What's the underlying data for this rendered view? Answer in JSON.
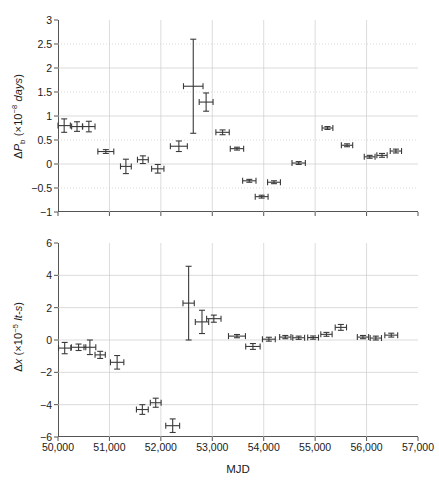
{
  "figure": {
    "xlabel": "MJD",
    "xticks": [
      "50,000",
      "51,000",
      "52,000",
      "53,000",
      "54,000",
      "55,000",
      "56,000",
      "57,000"
    ],
    "xtick_values": [
      50000,
      51000,
      52000,
      53000,
      54000,
      55000,
      56000,
      57000
    ],
    "xlim": [
      50000,
      57000
    ],
    "axis_color": "#555555",
    "grid_color": "#cccccc",
    "marker_color": "#3a3a3a"
  },
  "chart_data": [
    {
      "type": "scatter",
      "panel": "top",
      "title": "",
      "xlabel": "",
      "ylabel": "ΔP_b (×10⁻⁸ days)",
      "ylabel_parts": {
        "delta": "Δ",
        "symbol": "P",
        "subscript": "b",
        "units_prefix": " (×10",
        "exponent": "−8",
        "units": " days)"
      },
      "xlim": [
        50000,
        57000
      ],
      "ylim": [
        -1,
        3
      ],
      "yticks": [
        "-1",
        "-0.5",
        "0",
        "0.5",
        "1",
        "1.5",
        "2",
        "2.5",
        "3"
      ],
      "ytick_values": [
        -1,
        -0.5,
        0,
        0.5,
        1,
        1.5,
        2,
        2.5,
        3
      ],
      "grid": true,
      "legend": "none",
      "points": [
        {
          "x": 50120,
          "y": 0.8,
          "xerr": 120,
          "yerr": 0.14
        },
        {
          "x": 50370,
          "y": 0.78,
          "xerr": 105,
          "yerr": 0.1
        },
        {
          "x": 50600,
          "y": 0.78,
          "xerr": 120,
          "yerr": 0.11
        },
        {
          "x": 50930,
          "y": 0.26,
          "xerr": 155,
          "yerr": 0.04
        },
        {
          "x": 51320,
          "y": -0.05,
          "xerr": 105,
          "yerr": 0.15
        },
        {
          "x": 51650,
          "y": 0.09,
          "xerr": 105,
          "yerr": 0.08
        },
        {
          "x": 51940,
          "y": -0.1,
          "xerr": 120,
          "yerr": 0.09
        },
        {
          "x": 52350,
          "y": 0.37,
          "xerr": 165,
          "yerr": 0.11
        },
        {
          "x": 52630,
          "y": 1.62,
          "xerr": 190,
          "yerr": 0.98
        },
        {
          "x": 52880,
          "y": 1.29,
          "xerr": 135,
          "yerr": 0.19
        },
        {
          "x": 53200,
          "y": 0.66,
          "xerr": 130,
          "yerr": 0.05
        },
        {
          "x": 53480,
          "y": 0.32,
          "xerr": 130,
          "yerr": 0.03
        },
        {
          "x": 53720,
          "y": -0.35,
          "xerr": 130,
          "yerr": 0.03
        },
        {
          "x": 53960,
          "y": -0.68,
          "xerr": 125,
          "yerr": 0.03
        },
        {
          "x": 54200,
          "y": -0.38,
          "xerr": 125,
          "yerr": 0.03
        },
        {
          "x": 54680,
          "y": 0.02,
          "xerr": 130,
          "yerr": 0.03
        },
        {
          "x": 55240,
          "y": 0.75,
          "xerr": 105,
          "yerr": 0.03
        },
        {
          "x": 55620,
          "y": 0.39,
          "xerr": 110,
          "yerr": 0.03
        },
        {
          "x": 56060,
          "y": 0.15,
          "xerr": 105,
          "yerr": 0.03
        },
        {
          "x": 56300,
          "y": 0.18,
          "xerr": 100,
          "yerr": 0.04
        },
        {
          "x": 56570,
          "y": 0.27,
          "xerr": 110,
          "yerr": 0.04
        }
      ]
    },
    {
      "type": "scatter",
      "panel": "bottom",
      "title": "",
      "xlabel": "MJD",
      "ylabel": "Δx (×10⁻⁵ lt-s)",
      "ylabel_parts": {
        "delta": "Δ",
        "symbol": "x",
        "units_prefix": " (×10",
        "exponent": "−5",
        "units": " lt-s)"
      },
      "xlim": [
        50000,
        57000
      ],
      "ylim": [
        -6,
        6
      ],
      "yticks": [
        "-6",
        "-4",
        "-2",
        "0",
        "2",
        "4",
        "6"
      ],
      "ytick_values": [
        -6,
        -4,
        -2,
        0,
        2,
        4,
        6
      ],
      "grid": true,
      "legend": "none",
      "points": [
        {
          "x": 50130,
          "y": -0.5,
          "xerr": 120,
          "yerr": 0.35
        },
        {
          "x": 50400,
          "y": -0.45,
          "xerr": 140,
          "yerr": 0.2
        },
        {
          "x": 50620,
          "y": -0.45,
          "xerr": 115,
          "yerr": 0.45
        },
        {
          "x": 50820,
          "y": -0.92,
          "xerr": 100,
          "yerr": 0.22
        },
        {
          "x": 51150,
          "y": -1.38,
          "xerr": 130,
          "yerr": 0.42
        },
        {
          "x": 51640,
          "y": -4.3,
          "xerr": 115,
          "yerr": 0.3
        },
        {
          "x": 51900,
          "y": -3.88,
          "xerr": 105,
          "yerr": 0.28
        },
        {
          "x": 52230,
          "y": -5.3,
          "xerr": 135,
          "yerr": 0.42
        },
        {
          "x": 52540,
          "y": 2.28,
          "xerr": 110,
          "yerr": 2.28
        },
        {
          "x": 52800,
          "y": 1.12,
          "xerr": 130,
          "yerr": 0.72
        },
        {
          "x": 53030,
          "y": 1.32,
          "xerr": 140,
          "yerr": 0.22
        },
        {
          "x": 53480,
          "y": 0.24,
          "xerr": 165,
          "yerr": 0.1
        },
        {
          "x": 53790,
          "y": -0.4,
          "xerr": 140,
          "yerr": 0.18
        },
        {
          "x": 54100,
          "y": 0.05,
          "xerr": 125,
          "yerr": 0.12
        },
        {
          "x": 54420,
          "y": 0.18,
          "xerr": 110,
          "yerr": 0.1
        },
        {
          "x": 54680,
          "y": 0.14,
          "xerr": 115,
          "yerr": 0.1
        },
        {
          "x": 54960,
          "y": 0.15,
          "xerr": 105,
          "yerr": 0.1
        },
        {
          "x": 55220,
          "y": 0.35,
          "xerr": 110,
          "yerr": 0.12
        },
        {
          "x": 55500,
          "y": 0.78,
          "xerr": 110,
          "yerr": 0.18
        },
        {
          "x": 55930,
          "y": 0.18,
          "xerr": 110,
          "yerr": 0.1
        },
        {
          "x": 56180,
          "y": 0.12,
          "xerr": 110,
          "yerr": 0.12
        },
        {
          "x": 56480,
          "y": 0.3,
          "xerr": 125,
          "yerr": 0.12
        }
      ]
    }
  ]
}
